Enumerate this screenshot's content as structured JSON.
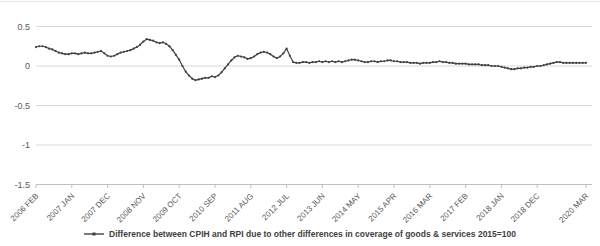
{
  "chart_data": {
    "type": "line",
    "title": "",
    "legend": "Difference between CPIH and RPI due to other differences in coverage of goods & services 2015=100",
    "legend_position": "bottom-center",
    "grid": true,
    "x_start": "2006 FEB",
    "x_end": "2020 MAR",
    "x_tick_labels": [
      "2006 FEB",
      "2007 JAN",
      "2007 DEC",
      "2008 NOV",
      "2009 OCT",
      "2010 SEP",
      "2011 AUG",
      "2012 JUL",
      "2013 JUN",
      "2014 MAY",
      "2015 APR",
      "2016 MAR",
      "2017 FEB",
      "2018 JAN",
      "2018 DEC",
      "2020 MAR"
    ],
    "x_tick_month_index": [
      0,
      11,
      22,
      33,
      44,
      55,
      66,
      77,
      88,
      99,
      110,
      121,
      132,
      143,
      154,
      169
    ],
    "y_tick_labels": [
      "0.5",
      "0",
      "-0.5",
      "-1",
      "-1.5"
    ],
    "y_tick_values": [
      0.5,
      0,
      -0.5,
      -1,
      -1.5
    ],
    "ylim": [
      -1.5,
      0.5
    ],
    "series": [
      {
        "name": "Difference between CPIH and RPI due to other differences in coverage of goods & services 2015=100",
        "color": "#404040",
        "frequency": "monthly",
        "values": [
          0.24,
          0.25,
          0.25,
          0.24,
          0.22,
          0.21,
          0.19,
          0.17,
          0.16,
          0.15,
          0.15,
          0.16,
          0.16,
          0.15,
          0.16,
          0.17,
          0.16,
          0.16,
          0.17,
          0.18,
          0.19,
          0.16,
          0.13,
          0.12,
          0.13,
          0.15,
          0.17,
          0.18,
          0.19,
          0.2,
          0.22,
          0.24,
          0.27,
          0.31,
          0.34,
          0.33,
          0.32,
          0.3,
          0.29,
          0.3,
          0.28,
          0.25,
          0.2,
          0.14,
          0.08,
          0.0,
          -0.07,
          -0.12,
          -0.16,
          -0.18,
          -0.17,
          -0.16,
          -0.15,
          -0.15,
          -0.13,
          -0.14,
          -0.12,
          -0.08,
          -0.03,
          0.02,
          0.07,
          0.11,
          0.13,
          0.12,
          0.11,
          0.09,
          0.1,
          0.12,
          0.15,
          0.17,
          0.18,
          0.17,
          0.15,
          0.12,
          0.1,
          0.12,
          0.16,
          0.22,
          0.13,
          0.05,
          0.04,
          0.04,
          0.05,
          0.05,
          0.04,
          0.05,
          0.05,
          0.06,
          0.05,
          0.06,
          0.05,
          0.06,
          0.05,
          0.06,
          0.05,
          0.06,
          0.07,
          0.08,
          0.08,
          0.07,
          0.06,
          0.05,
          0.05,
          0.06,
          0.06,
          0.05,
          0.06,
          0.06,
          0.07,
          0.07,
          0.06,
          0.06,
          0.05,
          0.05,
          0.05,
          0.04,
          0.04,
          0.04,
          0.03,
          0.04,
          0.04,
          0.04,
          0.05,
          0.05,
          0.06,
          0.05,
          0.05,
          0.04,
          0.04,
          0.03,
          0.03,
          0.03,
          0.03,
          0.02,
          0.02,
          0.02,
          0.02,
          0.01,
          0.01,
          0.01,
          0.0,
          0.0,
          0.0,
          -0.01,
          -0.02,
          -0.03,
          -0.04,
          -0.04,
          -0.03,
          -0.03,
          -0.02,
          -0.02,
          -0.01,
          -0.01,
          0.0,
          0.0,
          0.01,
          0.02,
          0.03,
          0.04,
          0.05,
          0.05,
          0.04,
          0.04,
          0.04,
          0.04,
          0.04,
          0.04,
          0.04,
          0.04
        ]
      }
    ],
    "colors": {
      "series_line": "#404040",
      "gridline": "#d9d9d9",
      "axis_line": "#bfbfbf",
      "tick_label": "#595959",
      "legend_text": "#404040",
      "top_border": "#e3e3e3",
      "background": "#ffffff"
    }
  }
}
